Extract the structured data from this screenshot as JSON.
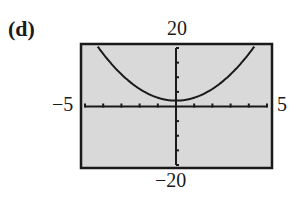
{
  "panel": {
    "label": "(d)"
  },
  "labels": {
    "ymax": "20",
    "ymin": "−20",
    "xmin": "−5",
    "xmax": "5"
  },
  "colors": {
    "plot_background": "#d9d9d9",
    "frame": "#1a1a1a",
    "axis": "#1a1a1a",
    "curve": "#1a1a1a"
  },
  "chart_data": {
    "type": "line",
    "title": "(d)",
    "xlabel": "",
    "ylabel": "",
    "xlim": [
      -5,
      5
    ],
    "ylim": [
      -20,
      20
    ],
    "x_tick_step": 1,
    "y_tick_step": 5,
    "grid": false,
    "legend": null,
    "window_labels": {
      "top": "20",
      "bottom": "-20",
      "left": "-5",
      "right": "5"
    },
    "series": [
      {
        "name": "y = x^2 + 2 (approx.)",
        "x": [
          -4.3,
          -4,
          -3,
          -2,
          -1,
          0,
          1,
          2,
          3,
          4,
          4.3
        ],
        "y": [
          20.5,
          18,
          11,
          6,
          3,
          2,
          3,
          6,
          11,
          18,
          20.5
        ]
      }
    ]
  }
}
